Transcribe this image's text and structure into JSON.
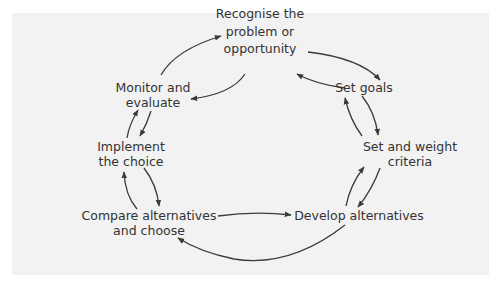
{
  "diagram": {
    "type": "cycle",
    "colors": {
      "background": "#f2f2f2",
      "text": "#333333",
      "arrow": "#3a3a3a"
    },
    "nodes": [
      {
        "id": "recognise",
        "lines": [
          "Recognise the",
          "problem or",
          "opportunity"
        ]
      },
      {
        "id": "set-goals",
        "lines": [
          "Set goals"
        ]
      },
      {
        "id": "set-weight",
        "lines": [
          "Set and weight",
          "criteria"
        ]
      },
      {
        "id": "develop",
        "lines": [
          "Develop alternatives"
        ]
      },
      {
        "id": "compare",
        "lines": [
          "Compare alternatives",
          "and choose"
        ]
      },
      {
        "id": "implement",
        "lines": [
          "Implement",
          "the choice"
        ]
      },
      {
        "id": "monitor",
        "lines": [
          "Monitor and",
          "evaluate"
        ]
      }
    ],
    "edges": [
      {
        "from": "recognise",
        "to": "set-goals"
      },
      {
        "from": "set-goals",
        "to": "recognise"
      },
      {
        "from": "set-goals",
        "to": "set-weight"
      },
      {
        "from": "set-weight",
        "to": "set-goals"
      },
      {
        "from": "set-weight",
        "to": "develop"
      },
      {
        "from": "develop",
        "to": "set-weight"
      },
      {
        "from": "compare",
        "to": "develop"
      },
      {
        "from": "develop",
        "to": "compare"
      },
      {
        "from": "compare",
        "to": "implement"
      },
      {
        "from": "implement",
        "to": "compare"
      },
      {
        "from": "implement",
        "to": "monitor"
      },
      {
        "from": "monitor",
        "to": "implement"
      },
      {
        "from": "monitor",
        "to": "recognise"
      },
      {
        "from": "recognise",
        "to": "monitor"
      }
    ]
  }
}
